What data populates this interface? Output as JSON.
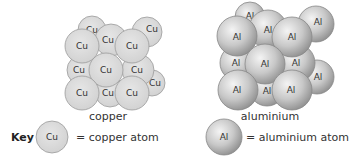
{
  "diagram": {
    "structures": [
      {
        "name": "copper",
        "caption": "copper",
        "atom_symbol": "Cu",
        "style": "flat-gray"
      },
      {
        "name": "aluminium",
        "caption": "aluminium",
        "atom_symbol": "Al",
        "style": "shaded-sphere"
      }
    ],
    "key": {
      "heading": "Key",
      "items": [
        {
          "symbol": "Cu",
          "label": "= copper atom"
        },
        {
          "symbol": "Al",
          "label": "= aluminium atom"
        }
      ]
    },
    "colors": {
      "copper_fill": "#dcdcdc",
      "copper_stroke": "#9a9a9a",
      "aluminium_light": "#f2f2f2",
      "aluminium_dark": "#9c9c9c",
      "aluminium_stroke": "#888888",
      "text": "#333333"
    }
  }
}
